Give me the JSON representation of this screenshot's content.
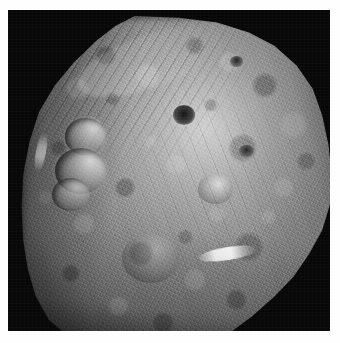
{
  "page": {
    "background_color": "#ffffff",
    "width": 340,
    "height": 343
  },
  "figure": {
    "kind": "spacecraft-photograph",
    "caption": "",
    "frame": {
      "background_color": "#070707",
      "left": 8,
      "top": 10,
      "width": 322,
      "height": 321
    },
    "palette": {
      "space_black": "#070707",
      "surface_mid_gray": "#8a8a8a",
      "surface_highlight": "#dcdcdc",
      "surface_shadow": "#1a1a1a",
      "page_white": "#ffffff"
    },
    "body": {
      "label": "asteroid-body",
      "shape": "irregular-oblate",
      "illumination": "lit from upper right, terminator along lower-left limb"
    },
    "features": [
      {
        "id": "crater-snowman-top",
        "label": "snowman crater (upper)"
      },
      {
        "id": "crater-snowman-mid",
        "label": "snowman crater (middle)"
      },
      {
        "id": "crater-snowman-bottom",
        "label": "snowman crater (lower)"
      },
      {
        "id": "crater-dark-central",
        "label": "dark-floored central crater"
      },
      {
        "id": "crater-small-ne",
        "label": "small crater, northeast"
      },
      {
        "id": "crater-small-e",
        "label": "small crater, east"
      },
      {
        "id": "crater-rim-bright-se",
        "label": "bright-rimmed crater, southeast"
      },
      {
        "id": "crater-basin-south",
        "label": "shallow basin, south"
      },
      {
        "id": "streak-bright-se",
        "label": "bright ejecta streak, southeast flank"
      },
      {
        "id": "streak-bright-w",
        "label": "bright scarp highlight, west limb"
      },
      {
        "id": "grooves",
        "label": "limb grooves, northwest"
      },
      {
        "id": "grooves2",
        "label": "equatorial troughs"
      },
      {
        "id": "ridge-highlight-nw",
        "label": "illuminated ridge, northwest limb"
      }
    ]
  }
}
